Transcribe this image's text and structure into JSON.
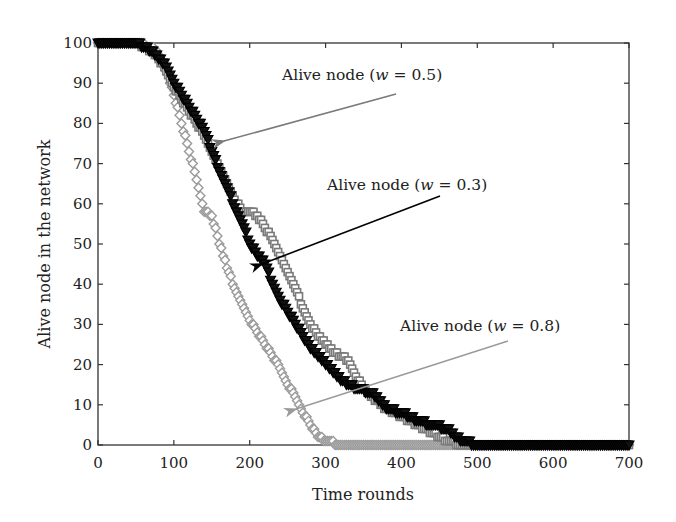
{
  "chart_data": {
    "type": "scatter",
    "title": "",
    "xlabel": "Time rounds",
    "ylabel": "Alive node in the network",
    "xlim": [
      0,
      700
    ],
    "ylim": [
      0,
      100
    ],
    "xticks": [
      0,
      100,
      200,
      300,
      400,
      500,
      600,
      700
    ],
    "yticks": [
      0,
      10,
      20,
      30,
      40,
      50,
      60,
      70,
      80,
      90,
      100
    ],
    "grid": false,
    "legend": "none (inline annotations with arrows)",
    "series": [
      {
        "name": "Alive node (w = 0.5)",
        "marker": "square-open",
        "color": "#7a7a7a",
        "x": [
          0,
          50,
          70,
          80,
          90,
          100,
          110,
          120,
          130,
          140,
          150,
          160,
          170,
          180,
          190,
          200,
          210,
          220,
          230,
          240,
          250,
          260,
          270,
          280,
          290,
          300,
          310,
          320,
          330,
          340,
          350,
          360,
          380,
          400,
          420,
          440,
          460,
          480,
          500,
          600,
          700
        ],
        "y": [
          100,
          100,
          98,
          96,
          93,
          89,
          86,
          83,
          80,
          77,
          73,
          69,
          65,
          61,
          58,
          58,
          57,
          54,
          51,
          47,
          43,
          39,
          34,
          30,
          27,
          25,
          23,
          22,
          21,
          17,
          14,
          12,
          9,
          7,
          5,
          3,
          1,
          0,
          0,
          0,
          0
        ]
      },
      {
        "name": "Alive node (w = 0.3)",
        "marker": "triangle-down",
        "color": "#000000",
        "x": [
          0,
          50,
          70,
          80,
          90,
          100,
          110,
          120,
          130,
          140,
          150,
          160,
          170,
          180,
          190,
          200,
          210,
          220,
          230,
          240,
          250,
          260,
          270,
          280,
          290,
          300,
          310,
          320,
          340,
          360,
          380,
          400,
          420,
          440,
          460,
          470,
          480,
          500,
          600,
          700
        ],
        "y": [
          100,
          100,
          98,
          96,
          94,
          90,
          87,
          84,
          81,
          78,
          73,
          68,
          64,
          59,
          55,
          50,
          47,
          45,
          40,
          36,
          33,
          30,
          27,
          24,
          22,
          20,
          18,
          16,
          14,
          13,
          9,
          8,
          6,
          5,
          4,
          2,
          1,
          0,
          0,
          0
        ]
      },
      {
        "name": "Alive node (w = 0.8)",
        "marker": "diamond-open",
        "color": "#9a9a9a",
        "x": [
          0,
          50,
          70,
          80,
          90,
          100,
          110,
          120,
          130,
          140,
          150,
          160,
          170,
          180,
          190,
          200,
          210,
          220,
          230,
          240,
          250,
          260,
          270,
          280,
          290,
          300,
          320,
          350,
          400,
          450,
          500,
          600,
          700
        ],
        "y": [
          100,
          100,
          99,
          97,
          93,
          87,
          80,
          73,
          66,
          58,
          57,
          50,
          44,
          39,
          35,
          31,
          28,
          25,
          22,
          19,
          15,
          12,
          8,
          5,
          2,
          1,
          0,
          0,
          0,
          0,
          0,
          0,
          0
        ]
      }
    ],
    "annotations": [
      {
        "text": "Alive node (w = 0.5)",
        "text_anchor_px": [
          280,
          75
        ],
        "arrow_to": [
          165,
          73
        ],
        "arrow_color": "#7a7a7a"
      },
      {
        "text": "Alive node (w = 0.3)",
        "text_anchor_px": [
          327,
          190
        ],
        "arrow_to": [
          205,
          45
        ],
        "arrow_color": "#000000"
      },
      {
        "text": "Alive node (w = 0.8)",
        "text_anchor_px": [
          399,
          330
        ],
        "arrow_to": [
          260,
          9
        ],
        "arrow_color": "#9a9a9a"
      }
    ]
  },
  "labels": {
    "xlabel": "Time rounds",
    "ylabel": "Alive node in the network",
    "annot_05_prefix": "Alive node (",
    "annot_03_prefix": "Alive node (",
    "annot_08_prefix": "Alive node (",
    "annot_w": "w",
    "annot_05_suffix": " = 0.5)",
    "annot_03_suffix": " = 0.3)",
    "annot_08_suffix": " = 0.8)"
  }
}
